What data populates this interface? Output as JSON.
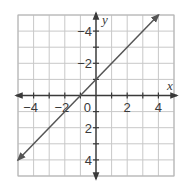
{
  "chart_data": {
    "type": "line",
    "title": "",
    "xlabel": "x",
    "ylabel": "y",
    "xlim": [
      -5,
      5
    ],
    "ylim": [
      -5,
      5
    ],
    "grid": true,
    "x_ticks": [
      -4,
      -2,
      0,
      2,
      4
    ],
    "y_ticks": [
      -4,
      -2,
      2,
      4
    ],
    "x_tick_labels": [
      "−4",
      "−2",
      "2",
      "4"
    ],
    "y_tick_labels": [
      "4",
      "2",
      "−2",
      "−4"
    ],
    "origin_label": "0",
    "series": [
      {
        "name": "y = x + 1",
        "equation": "y = x + 1",
        "slope": 1,
        "intercept": 1,
        "x": [
          -5,
          -1,
          0,
          4
        ],
        "y": [
          -4,
          0,
          1,
          5
        ],
        "arrows_both_ends": true,
        "color": "#555555"
      }
    ]
  },
  "colors": {
    "grid": "#c8c8c8",
    "axis": "#3a3a3a",
    "line": "#555555",
    "border": "#b5b5b5"
  }
}
